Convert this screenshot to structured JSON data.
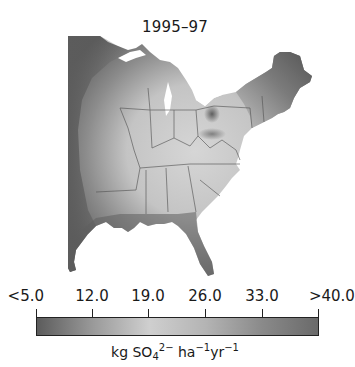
{
  "title": "1995–97",
  "map": {
    "region": "Eastern United States",
    "variable": "sulfate wet deposition",
    "colors": {
      "low": "#5a5a5a",
      "mid": "#d0d0d0",
      "high": "#6e6e6e",
      "boundary": "#555555",
      "background": "#ffffff"
    }
  },
  "colorbar": {
    "tick_labels": [
      "<5.0",
      "12.0",
      "19.0",
      "26.0",
      "33.0",
      ">40.0"
    ],
    "tick_values": [
      5.0,
      12.0,
      19.0,
      26.0,
      33.0,
      40.0
    ],
    "units": {
      "prefix": "kg SO",
      "sub": "4",
      "sup1": "2−",
      "mid": " ha",
      "sup2": "−1",
      "mid2": "yr",
      "sup3": "−1"
    },
    "gradient_stops": [
      "#5c5c5c",
      "#9a9a9a",
      "#cfcfcf",
      "#b4b4b4",
      "#8a8a8a",
      "#6a6a6a"
    ]
  }
}
